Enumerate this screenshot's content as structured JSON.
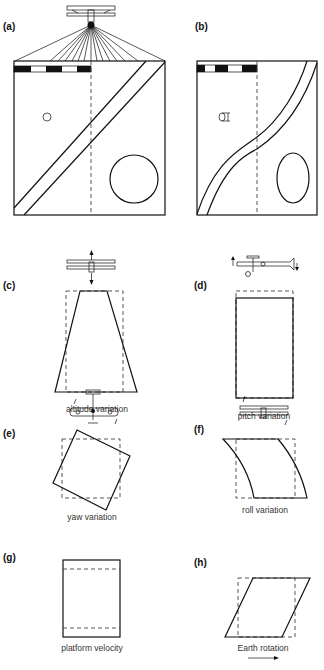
{
  "figure": {
    "panels": [
      {
        "id": "a",
        "label": "(a)",
        "caption": ""
      },
      {
        "id": "b",
        "label": "(b)",
        "caption": ""
      },
      {
        "id": "c",
        "label": "(c)",
        "caption": "altitude variation"
      },
      {
        "id": "d",
        "label": "(d)",
        "caption": "pitch variation"
      },
      {
        "id": "e",
        "label": "(e)",
        "caption": "yaw variation"
      },
      {
        "id": "f",
        "label": "(f)",
        "caption": "roll variation"
      },
      {
        "id": "g",
        "label": "(g)",
        "caption": "platform velocity"
      },
      {
        "id": "h",
        "label": "(h)",
        "caption": "Earth rotation"
      }
    ],
    "icons": {
      "aircraft": "biplane-icon",
      "motion_arrow": "arrow-icon",
      "earth_rotation_arrow": "right-arrow-icon"
    },
    "colors": {
      "ink": "#111111",
      "dashed": "#444444",
      "background": "#ffffff"
    }
  }
}
